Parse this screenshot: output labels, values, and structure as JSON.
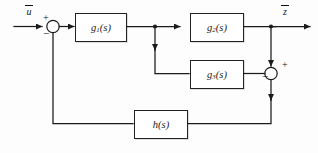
{
  "diagram": {
    "type": "control-block-diagram",
    "input_label": "u",
    "input_label_overbar": true,
    "output_label": "z",
    "output_label_overbar": true,
    "blocks": [
      {
        "id": "g1",
        "label_base": "g",
        "label_sub": "1",
        "label_arg": "(s)",
        "label": "g1(s)"
      },
      {
        "id": "g2",
        "label_base": "g",
        "label_sub": "2",
        "label_arg": "(s)",
        "label": "g2(s)"
      },
      {
        "id": "g3",
        "label_base": "g",
        "label_sub": "3",
        "label_arg": "(s)",
        "label": "g3(s)"
      },
      {
        "id": "h",
        "label_base": "h",
        "label_sub": "",
        "label_arg": "(s)",
        "label": "h(s)"
      }
    ],
    "summing_junctions": [
      {
        "id": "sum1",
        "plus": "+",
        "minus": "−"
      },
      {
        "id": "sum2",
        "plus": "+",
        "minus": "−"
      }
    ],
    "colors": {
      "line": "#1b1b1b",
      "block_fill": "#ffffff",
      "block_stroke": "#222222",
      "background": "#fdfdfd",
      "text": "#1a1a1a"
    }
  }
}
